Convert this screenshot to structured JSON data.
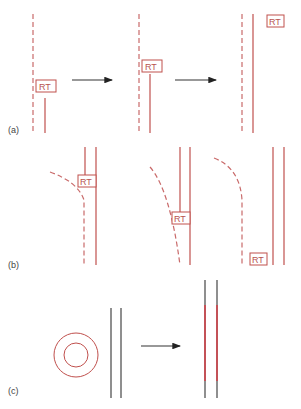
{
  "figure": {
    "panels": [
      {
        "label": "(a)",
        "marker_label": "RT",
        "steps": 3
      },
      {
        "label": "(b)",
        "marker_label": "RT",
        "steps": 3
      },
      {
        "label": "(c)",
        "steps": 2
      }
    ],
    "colors": {
      "strand": "#c0504d",
      "dashed_strand": "#c96a6a",
      "dna": "#333333",
      "new_strand": "#e0303a",
      "arrow": "#222222"
    }
  }
}
